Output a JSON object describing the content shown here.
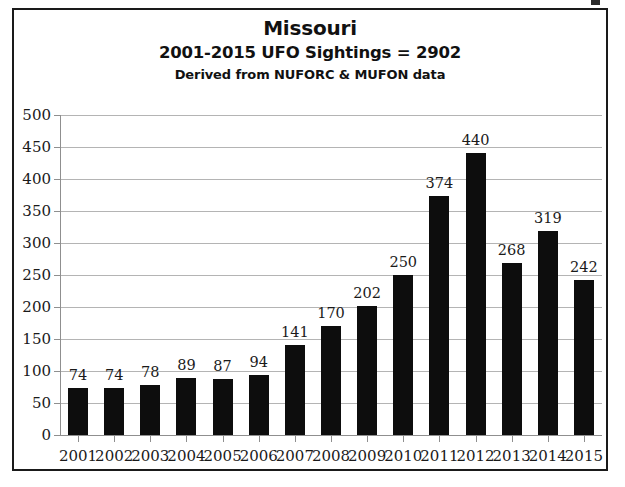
{
  "chart_data": {
    "type": "bar",
    "title": "Missouri",
    "subtitle": "2001-2015  UFO Sightings =  2902",
    "source_note": "Derived from NUFORC & MUFON data",
    "categories": [
      "2001",
      "2002",
      "2003",
      "2004",
      "2005",
      "2006",
      "2007",
      "2008",
      "2009",
      "2010",
      "2011",
      "2012",
      "2013",
      "2014",
      "2015"
    ],
    "values": [
      74,
      74,
      78,
      89,
      87,
      94,
      141,
      170,
      202,
      250,
      374,
      440,
      268,
      319,
      242
    ],
    "xlabel": "",
    "ylabel": "",
    "ylim": [
      0,
      500
    ],
    "ytick_step": 50,
    "yticks": [
      0,
      50,
      100,
      150,
      200,
      250,
      300,
      350,
      400,
      450,
      500
    ],
    "grid": true,
    "legend": false,
    "bar_color": "#0d0d0d",
    "grid_color": "#b4b4b4",
    "total": 2902
  }
}
